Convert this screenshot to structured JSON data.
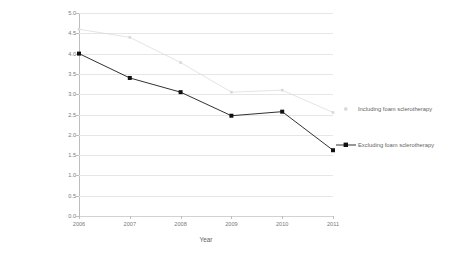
{
  "chart_data": {
    "type": "line",
    "title": "",
    "subtitle": "",
    "xlabel": "Year",
    "ylabel": "Mean Sessions per patient",
    "categories": [
      "2006",
      "2007",
      "2008",
      "2009",
      "2010",
      "2011"
    ],
    "x": [
      2006,
      2007,
      2008,
      2009,
      2010,
      2011
    ],
    "xlim": [
      2006,
      2011
    ],
    "ylim": [
      0.0,
      5.0
    ],
    "ytick_step": 0.5,
    "yticks": [
      "5.0",
      "4.5",
      "4.0",
      "3.5",
      "3.0",
      "2.5",
      "2.0",
      "1.5",
      "1.0",
      "0.5",
      "0.0"
    ],
    "ytick_values": [
      5.0,
      4.5,
      4.0,
      3.5,
      3.0,
      2.5,
      2.0,
      1.5,
      1.0,
      0.5,
      0.0
    ],
    "grid": true,
    "grid_axis": "y",
    "legend_position": "right",
    "series": [
      {
        "name": "Including foam sclerotherapy",
        "values": [
          4.6,
          4.4,
          3.78,
          3.05,
          3.1,
          2.55
        ],
        "color": "#d8d8d8",
        "marker": "square",
        "line_style": "solid"
      },
      {
        "name": "Excluding foam sclerotherapy",
        "values": [
          4.0,
          3.4,
          3.05,
          2.47,
          2.57,
          1.62
        ],
        "color": "#1a1a1a",
        "marker": "square",
        "line_style": "solid"
      }
    ]
  },
  "legend": {
    "entries": [
      {
        "label": "Including foam sclerotherapy"
      },
      {
        "label": "Excluding foam sclerotherapy"
      }
    ]
  },
  "colors": {
    "background": "#ffffff",
    "gridline": "#e6e6e6",
    "axis": "#bdbdbd",
    "text": "#6f6f6f",
    "series_including": "#d8d8d8",
    "series_excluding": "#1a1a1a"
  }
}
